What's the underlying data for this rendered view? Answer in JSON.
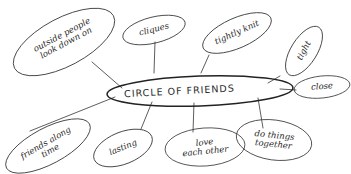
{
  "diagram": {
    "type": "mind-map",
    "center": {
      "label": "CIRCLE OF FRIENDS"
    },
    "nodes": [
      {
        "id": "outside",
        "label": "outside people\nlook down on"
      },
      {
        "id": "cliques",
        "label": "cliques"
      },
      {
        "id": "tightly",
        "label": "tightly knit"
      },
      {
        "id": "tight",
        "label": "tight"
      },
      {
        "id": "close",
        "label": "close"
      },
      {
        "id": "friends",
        "label": "friends along\ntime"
      },
      {
        "id": "lasting",
        "label": "lasting"
      },
      {
        "id": "love",
        "label": "love\neach other"
      },
      {
        "id": "together",
        "label": "do things\ntogether"
      }
    ],
    "colors": {
      "ink": "#2a2a2a",
      "background": "#ffffff"
    }
  }
}
